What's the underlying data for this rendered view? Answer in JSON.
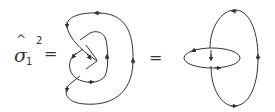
{
  "equation": {
    "lhs_symbol": "σ",
    "lhs_hat": "^",
    "lhs_subscript": "1",
    "lhs_superscript": "2",
    "equals_1": "=",
    "equals_2": "="
  },
  "figures": [
    {
      "name": "braid-closure-diagram",
      "description": "Closed oriented curve with crossings (closure of sigma_1 squared)",
      "arrows": 8
    },
    {
      "name": "hopf-link-diagram",
      "description": "Two linked oriented ellipses (Hopf link)",
      "arrows": 6
    }
  ],
  "colors": {
    "stroke": "#333333",
    "background": "#ffffff"
  }
}
